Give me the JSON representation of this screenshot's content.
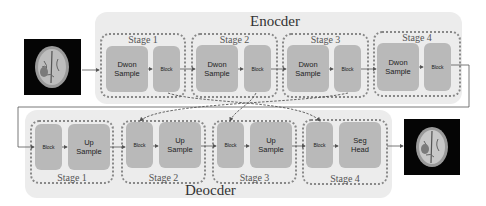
{
  "encoder": {
    "title": "Enocder",
    "stages": [
      {
        "label": "Stage 1",
        "first": "Dwon\nSample",
        "second": "Block"
      },
      {
        "label": "Stage 2",
        "first": "Dwon\nSample",
        "second": "Block"
      },
      {
        "label": "Stage 3",
        "first": "Dwon\nSample",
        "second": "Block"
      },
      {
        "label": "Stage 4",
        "first": "Dwon\nSample",
        "second": "Block"
      }
    ]
  },
  "decoder": {
    "title": "Deocder",
    "stages": [
      {
        "label": "Stage 1",
        "first": "Block",
        "second": "Up\nSample"
      },
      {
        "label": "Stage 2",
        "first": "Block",
        "second": "Up\nSample"
      },
      {
        "label": "Stage 3",
        "first": "Block",
        "second": "Up\nSample"
      },
      {
        "label": "Stage 4",
        "first": "Block",
        "second": "Seg\nHead"
      }
    ]
  },
  "images": {
    "input": "brain-mri-input",
    "output": "brain-mri-segmentation-output"
  },
  "colors": {
    "panel_bg": "#ececec",
    "box_fill": "#b9b9b9",
    "stage_border": "#888888",
    "arrow": "#555555"
  }
}
